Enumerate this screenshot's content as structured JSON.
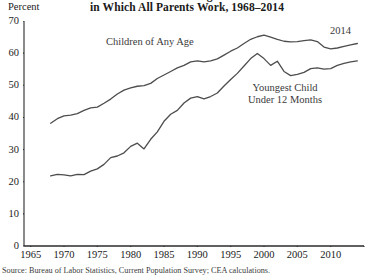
{
  "title": {
    "line1": "Share of Children Living in Households",
    "line2": "in Which All Parents Work, 1968–2014"
  },
  "axis_unit_label": "Percent",
  "source_note": "Source: Bureau of Labor Statistics, Current Population Survey; CEA calculations.",
  "annotations": {
    "any_age": "Children of Any Age",
    "under12_line1": "Youngest Child",
    "under12_line2": "Under 12 Months",
    "end_year": "2014"
  },
  "colors": {
    "line": "#4d4d4d",
    "axis": "#2b2b2b",
    "text": "#1a1a1a",
    "background": "#ffffff"
  },
  "chart_data": {
    "type": "line",
    "title": "Share of Children Living in Households in Which All Parents Work, 1968–2014",
    "xlabel": "",
    "ylabel": "Percent",
    "xlim": [
      1964.0,
      2015.0
    ],
    "ylim": [
      0,
      70
    ],
    "yticks": [
      0,
      10,
      20,
      30,
      40,
      50,
      60,
      70
    ],
    "xticks": [
      1965,
      1970,
      1975,
      1980,
      1985,
      1990,
      1995,
      2000,
      2005,
      2010
    ],
    "grid": false,
    "legend": "inline-annotations",
    "x": [
      1968,
      1969,
      1970,
      1971,
      1972,
      1973,
      1974,
      1975,
      1976,
      1977,
      1978,
      1979,
      1980,
      1981,
      1982,
      1983,
      1984,
      1985,
      1986,
      1987,
      1988,
      1989,
      1990,
      1991,
      1992,
      1993,
      1994,
      1995,
      1996,
      1997,
      1998,
      1999,
      2000,
      2001,
      2002,
      2003,
      2004,
      2005,
      2006,
      2007,
      2008,
      2009,
      2010,
      2011,
      2012,
      2013,
      2014
    ],
    "series": [
      {
        "name": "Children of Any Age",
        "values": [
          38.2,
          39.6,
          40.5,
          40.7,
          41.2,
          42.2,
          43.0,
          43.2,
          44.4,
          45.7,
          47.3,
          48.5,
          49.2,
          49.7,
          49.9,
          50.6,
          52.1,
          53.2,
          54.3,
          55.4,
          56.2,
          57.3,
          57.6,
          57.3,
          57.6,
          58.2,
          59.4,
          60.6,
          61.6,
          63.0,
          64.3,
          65.1,
          65.6,
          65.0,
          64.3,
          63.7,
          63.5,
          63.6,
          63.9,
          64.1,
          63.6,
          61.9,
          61.3,
          61.6,
          62.1,
          62.6,
          63.0
        ]
      },
      {
        "name": "Youngest Child Under 12 Months",
        "values": [
          21.8,
          22.3,
          22.1,
          21.8,
          22.3,
          22.2,
          23.3,
          24.0,
          25.4,
          27.5,
          28.0,
          29.0,
          31.0,
          32.0,
          30.2,
          33.2,
          35.5,
          38.8,
          41.0,
          42.2,
          44.5,
          46.0,
          46.5,
          45.8,
          46.5,
          47.6,
          49.8,
          51.8,
          53.7,
          56.0,
          58.3,
          59.9,
          58.3,
          56.2,
          57.5,
          54.3,
          53.0,
          53.4,
          54.0,
          55.2,
          55.4,
          55.0,
          55.2,
          56.2,
          56.8,
          57.3,
          57.6
        ]
      }
    ]
  }
}
